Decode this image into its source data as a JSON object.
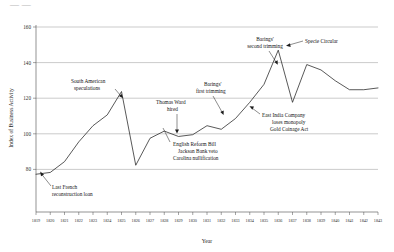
{
  "figure": {
    "cropped_header_text": "—  —",
    "background_color": "#ffffff",
    "line_color": "#222222",
    "grid_color": "#8a8a8a"
  },
  "chart_data": {
    "type": "line",
    "title": "",
    "xlabel": "Year",
    "ylabel": "Index of Business Activity",
    "xlim": [
      1819,
      1843
    ],
    "ylim": [
      58,
      162
    ],
    "yticks": [
      80,
      100,
      120,
      140,
      160
    ],
    "ytick_labels": [
      "80",
      "100",
      "120",
      "140",
      "160"
    ],
    "grid": true,
    "grid_axis": "y",
    "legend": "none",
    "x": [
      1819,
      1820,
      1821,
      1822,
      1823,
      1824,
      1825,
      1826,
      1827,
      1828,
      1829,
      1830,
      1831,
      1832,
      1833,
      1834,
      1835,
      1836,
      1837,
      1838,
      1839,
      1840,
      1841,
      1842,
      1843
    ],
    "xtick_labels": [
      "1819",
      "1820",
      "1821",
      "1822",
      "1823",
      "1824",
      "1825",
      "1826",
      "1827",
      "1828",
      "1829",
      "1830",
      "1831",
      "1832",
      "1833",
      "1834",
      "1835",
      "1836",
      "1837",
      "1838",
      "1839",
      "1840",
      "1841",
      "1842",
      "1843"
    ],
    "series": [
      {
        "name": "Index of Business Activity",
        "values": [
          79,
          80,
          86,
          97,
          106,
          112,
          125,
          84,
          99,
          103,
          100,
          101,
          106,
          104,
          110,
          119,
          129,
          148,
          119,
          140,
          137,
          131,
          126,
          126,
          127
        ]
      }
    ],
    "annotations": [
      {
        "id": "last-french-reconstruction-loan",
        "lines": [
          "Last French",
          "reconstruction loan"
        ],
        "target_x": 1819,
        "target_y": 79
      },
      {
        "id": "south-american-speculations",
        "lines": [
          "South American",
          "speculations"
        ],
        "target_x": 1824,
        "target_y": 112
      },
      {
        "id": "thomas-ward-hired",
        "lines": [
          "Thomas Ward",
          "hired"
        ],
        "target_x": 1829,
        "target_y": 100
      },
      {
        "id": "english-reform-bill",
        "lines": [
          "English Reform Bill",
          "Jackson Bank veto",
          "Carolina nullification"
        ],
        "target_x": 1832,
        "target_y": 104
      },
      {
        "id": "barings-first-trimming",
        "lines": [
          "Barings'",
          "first trimming"
        ],
        "target_x": 1833,
        "target_y": 110
      },
      {
        "id": "east-india-company",
        "lines": [
          "East India Company",
          "loses monopoly",
          "Gold Coinage Act"
        ],
        "target_x": 1834,
        "target_y": 119
      },
      {
        "id": "barings-second-trimming",
        "lines": [
          "Barings'",
          "second trimming"
        ],
        "target_x": 1835,
        "target_y": 129
      },
      {
        "id": "specie-circular",
        "lines": [
          "Specie Circular"
        ],
        "target_x": 1836,
        "target_y": 148
      }
    ]
  }
}
